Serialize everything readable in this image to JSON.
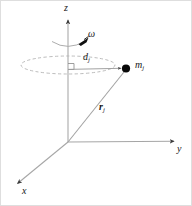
{
  "figure": {
    "type": "physics-vector-diagram",
    "width": 192,
    "height": 206,
    "background_color": "#ffffff",
    "border_color": "#d8d8d8"
  },
  "axes": {
    "z": {
      "label": "z",
      "description": "vertical rotation axis with upward arrowhead",
      "color": "#9a9a9a",
      "origin": [
        68,
        142
      ],
      "tip": [
        68,
        18
      ]
    },
    "y": {
      "label": "y",
      "description": "horizontal axis to the right with arrowhead",
      "color": "#9a9a9a",
      "origin": [
        68,
        142
      ],
      "tip": [
        176,
        141
      ]
    },
    "x": {
      "label": "x",
      "description": "axis toward lower-left with arrowhead",
      "color": "#9a9a9a",
      "origin": [
        68,
        142
      ],
      "tip": [
        16,
        185
      ]
    }
  },
  "annotations": {
    "omega": {
      "symbol": "ω",
      "description": "angular velocity, curved arrow encircling the z-axis",
      "color": "#161616"
    },
    "distance": {
      "symbol": "d",
      "subscript": "j",
      "description": "perpendicular distance from the z-axis to the mass element",
      "color": "#161616",
      "from": [
        68,
        69
      ],
      "to": [
        124,
        68
      ]
    },
    "position_vector": {
      "symbol": "r",
      "subscript": "j",
      "bold": true,
      "description": "position vector from the origin to the mass element",
      "color": "#161616",
      "from": [
        68,
        142
      ],
      "to": [
        126,
        70
      ]
    },
    "mass_point": {
      "symbol": "m",
      "subscript": "j",
      "description": "point mass marker, filled black dot",
      "color": "#000000",
      "position": [
        126,
        69
      ]
    },
    "rotation_circle": {
      "description": "dashed ellipse showing the circular path of the mass element",
      "color": "#b0b0b0",
      "center": [
        68,
        65
      ],
      "rx": 47,
      "ry": 9,
      "dash": "3 2"
    },
    "right_angle_marker": {
      "description": "small square indicating the perpendicular between d_j and the z-axis",
      "color": "#6f6f6f",
      "position": [
        68,
        69
      ],
      "size": 6
    }
  }
}
